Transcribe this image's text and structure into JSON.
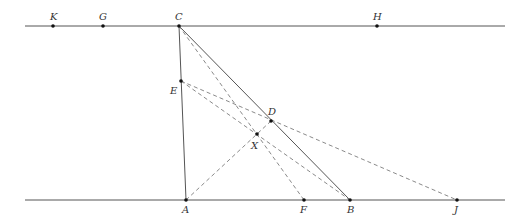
{
  "diagram": {
    "colors": {
      "solid": "#555555",
      "dashed": "#8a8a8a",
      "point": "#111111",
      "label": "#333333"
    },
    "lines": {
      "top": {
        "x1": 25,
        "y1": 26,
        "x2": 505,
        "y2": 26
      },
      "bottom": {
        "x1": 25,
        "y1": 200,
        "x2": 505,
        "y2": 200
      }
    },
    "points": {
      "K": {
        "x": 53,
        "y": 26,
        "label": "K"
      },
      "G": {
        "x": 103,
        "y": 26,
        "label": "G"
      },
      "C": {
        "x": 179,
        "y": 26,
        "label": "C"
      },
      "H": {
        "x": 377,
        "y": 26,
        "label": "H"
      },
      "E": {
        "x": 181,
        "y": 81,
        "label": "E"
      },
      "D": {
        "x": 271,
        "y": 121,
        "label": "D"
      },
      "X": {
        "x": 257,
        "y": 134,
        "label": "X"
      },
      "A": {
        "x": 186,
        "y": 200,
        "label": "A"
      },
      "F": {
        "x": 304,
        "y": 200,
        "label": "F"
      },
      "B": {
        "x": 350,
        "y": 200,
        "label": "B"
      },
      "J": {
        "x": 457,
        "y": 200,
        "label": "J"
      }
    },
    "segments_solid": [
      "C-A",
      "C-B"
    ],
    "segments_dashed": [
      "C-F",
      "E-B",
      "E-J",
      "A-D"
    ]
  }
}
